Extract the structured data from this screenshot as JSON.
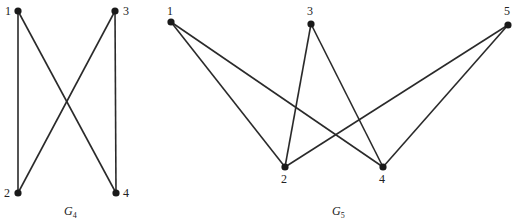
{
  "diagram": {
    "type": "graph-pair",
    "colors": {
      "edge": "#2a2a2a",
      "vertex": "#1a1a1a",
      "text": "#222222",
      "background": "#ffffff"
    },
    "graphs": [
      {
        "id": "G4",
        "title_main": "G",
        "title_sub": "4",
        "title_pos": {
          "x": 64,
          "y": 215
        },
        "nodes": [
          {
            "id": "1",
            "label": "1",
            "x": 18,
            "y": 11,
            "lx": 5,
            "ly": 15
          },
          {
            "id": "2",
            "label": "2",
            "x": 18,
            "y": 193,
            "lx": 4,
            "ly": 197
          },
          {
            "id": "3",
            "label": "3",
            "x": 115,
            "y": 11,
            "lx": 123,
            "ly": 15
          },
          {
            "id": "4",
            "label": "4",
            "x": 116,
            "y": 193,
            "lx": 123,
            "ly": 197
          }
        ],
        "edges": [
          [
            "1",
            "2"
          ],
          [
            "1",
            "4"
          ],
          [
            "3",
            "2"
          ],
          [
            "3",
            "4"
          ]
        ]
      },
      {
        "id": "G5",
        "title_main": "G",
        "title_sub": "5",
        "title_pos": {
          "x": 332,
          "y": 215
        },
        "nodes": [
          {
            "id": "1",
            "label": "1",
            "x": 171,
            "y": 22,
            "lx": 167,
            "ly": 15
          },
          {
            "id": "2",
            "label": "2",
            "x": 285,
            "y": 167,
            "lx": 281,
            "ly": 183
          },
          {
            "id": "3",
            "label": "3",
            "x": 311,
            "y": 24,
            "lx": 307,
            "ly": 15
          },
          {
            "id": "4",
            "label": "4",
            "x": 383,
            "y": 167,
            "lx": 379,
            "ly": 183
          },
          {
            "id": "5",
            "label": "5",
            "x": 508,
            "y": 25,
            "lx": 504,
            "ly": 15
          }
        ],
        "edges": [
          [
            "1",
            "2"
          ],
          [
            "1",
            "4"
          ],
          [
            "3",
            "2"
          ],
          [
            "3",
            "4"
          ],
          [
            "5",
            "2"
          ],
          [
            "5",
            "4"
          ]
        ]
      }
    ]
  }
}
